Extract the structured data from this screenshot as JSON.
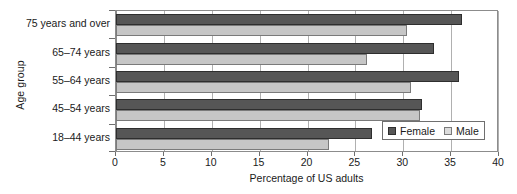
{
  "chart_data": {
    "type": "bar",
    "orientation": "horizontal",
    "title": "",
    "xlabel": "Percentage of US adults",
    "ylabel": "Age group",
    "categories": [
      "18–44 years",
      "45–54 years",
      "55–64 years",
      "65–74 years",
      "75 years and over"
    ],
    "series": [
      {
        "name": "Female",
        "color": "#565656",
        "values": [
          26.7,
          32.0,
          35.8,
          33.2,
          36.1
        ]
      },
      {
        "name": "Male",
        "color": "#c6c6c6",
        "values": [
          22.2,
          31.7,
          30.8,
          26.2,
          30.4
        ]
      }
    ],
    "xlim": [
      0,
      40
    ],
    "xticks": [
      0,
      5,
      10,
      15,
      20,
      25,
      30,
      35,
      40
    ],
    "xtick_labels": [
      "0",
      "5",
      "10",
      "15",
      "20",
      "25",
      "30",
      "35",
      "40"
    ],
    "grid": "vertical",
    "legend_position": "bottom-right",
    "legend_entries": [
      "Female",
      "Male"
    ]
  }
}
